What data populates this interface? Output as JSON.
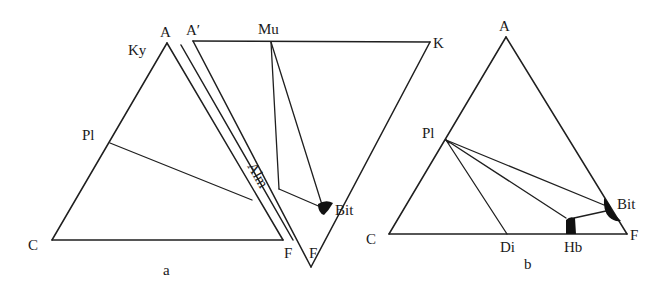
{
  "figure": {
    "panels": [
      {
        "id": "a",
        "caption": "a",
        "ternary_ACF": {
          "vertices": {
            "top": "A",
            "top_alt_label": "Ky",
            "left": "C",
            "right": "F"
          },
          "edge_points": {
            "left_edge": "Pl"
          }
        },
        "ternary_AKF": {
          "vertices": {
            "top_left": "A′",
            "top_right": "K",
            "bottom": "F"
          },
          "edge_points": {
            "top_edge": "Mu",
            "right_edge": "Bit"
          },
          "band_label": "Alm"
        }
      },
      {
        "id": "b",
        "caption": "b",
        "ternary_ACF": {
          "vertices": {
            "top": "A",
            "left": "C",
            "right": "F"
          },
          "edge_points": {
            "left_edge": "Pl",
            "bottom_edge_1": "Di",
            "bottom_edge_2": "Hb",
            "right_edge": "Bit"
          }
        }
      }
    ],
    "labels": {
      "a_A": "A",
      "a_Ky": "Ky",
      "a_Pl": "Pl",
      "a_C": "C",
      "a_F1": "F",
      "a_Aprime": "A′",
      "a_Mu": "Mu",
      "a_K": "K",
      "a_Alm": "Alm",
      "a_Bit": "Bit",
      "a_F2": "F",
      "a_caption": "a",
      "b_A": "A",
      "b_Pl": "Pl",
      "b_C": "C",
      "b_Di": "Di",
      "b_Hb": "Hb",
      "b_F": "F",
      "b_Bit": "Bit",
      "b_caption": "b"
    },
    "colors": {
      "line": "#1f1f1f",
      "phase_fill": "#111111",
      "background": "#ffffff"
    }
  }
}
